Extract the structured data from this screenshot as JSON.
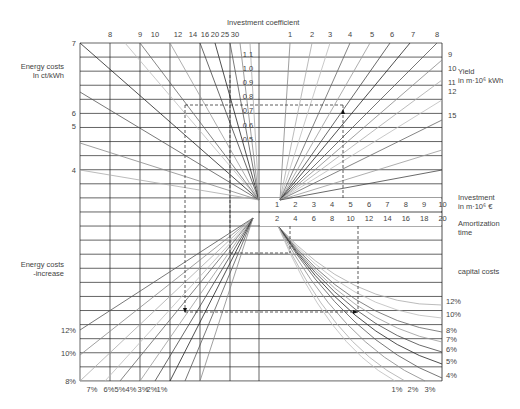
{
  "chart_data": {
    "type": "nomogram",
    "title": "Investment coefficient",
    "quadrants": {
      "top_left": {
        "ylabel": "Energy costs In ct/kWh",
        "y_ticks": [
          "7",
          "6",
          "5",
          "4"
        ],
        "top_ticks": [
          "8",
          "9",
          "10",
          "12",
          "14",
          "16",
          "20",
          "25",
          "30"
        ]
      },
      "top_center": {
        "ticks": [
          "1.1",
          "1.0",
          "0.9",
          "0.8",
          "0.7",
          "0.6",
          "0.5"
        ]
      },
      "top_right": {
        "top_ticks": [
          "1",
          "2",
          "3",
          "4",
          "5",
          "6",
          "7",
          "8"
        ],
        "right_label": "Yield in m·10⁶ kWh",
        "right_ticks": [
          "9",
          "10",
          "11",
          "12",
          "15"
        ]
      },
      "middle_axis": {
        "upper_label": "Investment in m·10⁶ €",
        "upper_ticks": [
          "1",
          "2",
          "3",
          "4",
          "5",
          "6",
          "7",
          "8",
          "9",
          "10"
        ],
        "lower_label": "Amortization time",
        "lower_ticks": [
          "2",
          "4",
          "6",
          "8",
          "10",
          "12",
          "14",
          "16",
          "18",
          "20"
        ]
      },
      "bottom_left": {
        "ylabel": "Energy costs -increase",
        "y_ticks": [
          "12%",
          "10%",
          "8%"
        ],
        "bottom_ticks": [
          "7%",
          "6%",
          "5%",
          "4%",
          "3%",
          "2%",
          "1%"
        ]
      },
      "bottom_right": {
        "right_label": "capital costs",
        "right_ticks": [
          "12%",
          "10%",
          "8%",
          "7%",
          "6%",
          "5%",
          "4%"
        ],
        "bottom_ticks": [
          "1%",
          "2%",
          "3%"
        ]
      }
    },
    "example_path": {
      "investment_coefficient": 0.75,
      "investment": 4.5,
      "amortization_time": 11
    }
  },
  "labels": {
    "title": "Investment coefficient",
    "energy_costs": "Energy costs",
    "energy_costs_unit": "In ct/kWh",
    "yield": "Yield",
    "yield_unit": "in m·10⁶ kWh",
    "investment": "Investment",
    "investment_unit": "in m·10⁶ €",
    "amortization": "Amortization",
    "amortization2": "time",
    "energy_increase": "Energy costs",
    "energy_increase2": "-increase",
    "capital_costs": "capital costs"
  }
}
